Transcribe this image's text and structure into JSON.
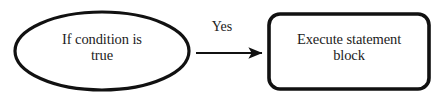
{
  "diagram": {
    "type": "flowchart",
    "background_color": "#ffffff",
    "stroke_color": "#111111",
    "text_color": "#1c1c1c",
    "nodes": [
      {
        "id": "condition",
        "shape": "ellipse",
        "label": "If condition is\ntrue",
        "cx": 102,
        "cy": 51,
        "rx": 87,
        "ry": 39,
        "stroke_width": 3.2
      },
      {
        "id": "execute",
        "shape": "rounded-rectangle",
        "label": "Execute statement\nblock",
        "x": 269,
        "y": 14,
        "width": 160,
        "height": 75,
        "corner_radius": 11,
        "stroke_width": 3.6
      }
    ],
    "edges": [
      {
        "id": "yes-edge",
        "from": "condition",
        "to": "execute",
        "label": "Yes",
        "x1": 196,
        "y1": 53,
        "x2": 266,
        "y2": 53,
        "stroke_width": 2.2,
        "arrowhead": "filled-triangle"
      }
    ]
  }
}
